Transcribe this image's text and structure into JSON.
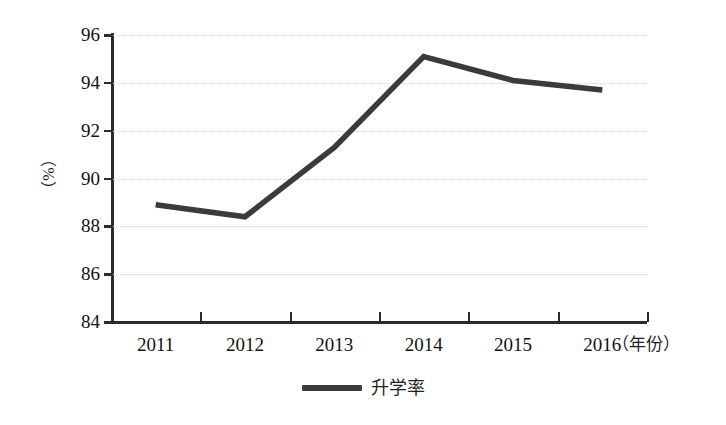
{
  "chart_data": {
    "type": "line",
    "title": "",
    "subtitle": "",
    "xlabel": "（年份）",
    "ylabel": "（%）",
    "categories": [
      "2011",
      "2012",
      "2013",
      "2014",
      "2015",
      "2016"
    ],
    "series": [
      {
        "name": "升学率",
        "values": [
          88.9,
          88.4,
          91.3,
          95.1,
          94.1,
          93.7
        ],
        "color": "#3b3b3b"
      }
    ],
    "ylim": [
      84,
      96
    ],
    "yticks": [
      96,
      94,
      92,
      90,
      88,
      86,
      84
    ],
    "ytick_labels": [
      "96",
      "94",
      "92",
      "90",
      "88",
      "86",
      "84"
    ],
    "grid": true,
    "grid_style": "dotted-horizontal",
    "grid_color": "#d8d6d6",
    "legend": {
      "position": "bottom-center",
      "entries": [
        "升学率"
      ]
    },
    "axis_color": "#2b2b2b",
    "background": "#ffffff"
  },
  "legend": {
    "label": "升学率",
    "marker": "line-swatch"
  },
  "axes": {
    "y_title": "（%）",
    "x_unit": "（年份）"
  }
}
